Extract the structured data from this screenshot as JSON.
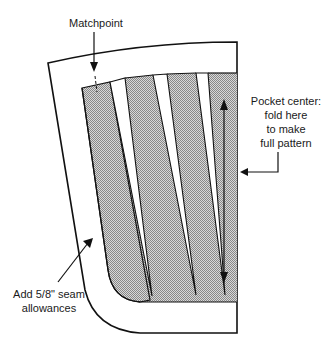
{
  "diagram": {
    "labels": {
      "matchpoint": "Matchpoint",
      "pocket_center_line1": "Pocket center:",
      "pocket_center_line2": "fold here",
      "pocket_center_line3": "to make",
      "pocket_center_line4": "full pattern",
      "seam_line1": "Add 5/8\" seam",
      "seam_line2": "allowances"
    },
    "colors": {
      "line": "#111111",
      "shade": "#b8b8b8",
      "background": "#ffffff"
    },
    "strips": 4
  }
}
